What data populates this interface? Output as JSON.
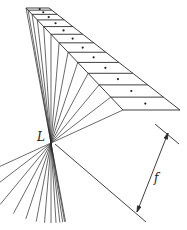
{
  "diagram": {
    "type": "optics-imaging-schematic",
    "colors": {
      "line": "#2a2a2a",
      "background": "#ffffff"
    },
    "labels": {
      "lens_point": "L",
      "focal_length": "f"
    },
    "object_strip": {
      "top_left": [
        26,
        8
      ],
      "top_right": [
        49,
        8
      ],
      "bottom_left": [
        123,
        110
      ],
      "bottom_right": [
        180,
        110
      ],
      "slices": 12
    },
    "lens_point": [
      51,
      143
    ],
    "image_plane_line": {
      "from": [
        55,
        144
      ],
      "to": [
        146,
        222
      ]
    },
    "reference_line": {
      "from": [
        155,
        124
      ],
      "to": [
        179,
        144
      ]
    },
    "dimension_arrow": {
      "from": [
        168,
        133
      ],
      "to": [
        137,
        212
      ]
    }
  }
}
